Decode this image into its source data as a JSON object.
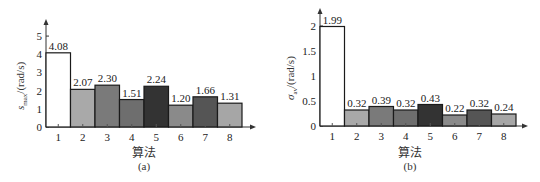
{
  "chart_data": [
    {
      "type": "bar",
      "panel": "(a)",
      "title": "",
      "xlabel": "算法",
      "ylabel": "s_max/(rad/s)",
      "ylabel_main": "s",
      "ylabel_sub": "max",
      "ylabel_unit": "/(rad/s)",
      "categories": [
        "1",
        "2",
        "3",
        "4",
        "5",
        "6",
        "7",
        "8"
      ],
      "values": [
        4.08,
        2.07,
        2.3,
        1.51,
        2.24,
        1.2,
        1.66,
        1.31
      ],
      "value_labels": [
        "4.08",
        "2.07",
        "2.30",
        "1.51",
        "2.24",
        "1.20",
        "1.66",
        "1.31"
      ],
      "yticks": [
        "0",
        "1",
        "2",
        "3",
        "4",
        "5"
      ],
      "ylim": [
        0,
        5.5
      ],
      "grid": false,
      "bar_colors": [
        "#ffffff",
        "#a9a9a9",
        "#7a7a7a",
        "#6e6e6e",
        "#333333",
        "#8a8a8a",
        "#555555",
        "#a6a6a6"
      ]
    },
    {
      "type": "bar",
      "panel": "(b)",
      "title": "",
      "xlabel": "算法",
      "ylabel": "σ_av/(rad/s)",
      "ylabel_main": "σ",
      "ylabel_sub": "av",
      "ylabel_unit": "/(rad/s)",
      "categories": [
        "1",
        "2",
        "3",
        "4",
        "5",
        "6",
        "7",
        "8"
      ],
      "values": [
        1.99,
        0.32,
        0.39,
        0.32,
        0.43,
        0.22,
        0.32,
        0.24
      ],
      "value_labels": [
        "1.99",
        "0.32",
        "0.39",
        "0.32",
        "0.43",
        "0.22",
        "0.32",
        "0.24"
      ],
      "yticks": [
        "0",
        "0.5",
        "1",
        "1.5",
        "2"
      ],
      "ylim": [
        0,
        2.2
      ],
      "grid": false,
      "bar_colors": [
        "#ffffff",
        "#a9a9a9",
        "#7a7a7a",
        "#6e6e6e",
        "#333333",
        "#8a8a8a",
        "#555555",
        "#a6a6a6"
      ]
    }
  ]
}
